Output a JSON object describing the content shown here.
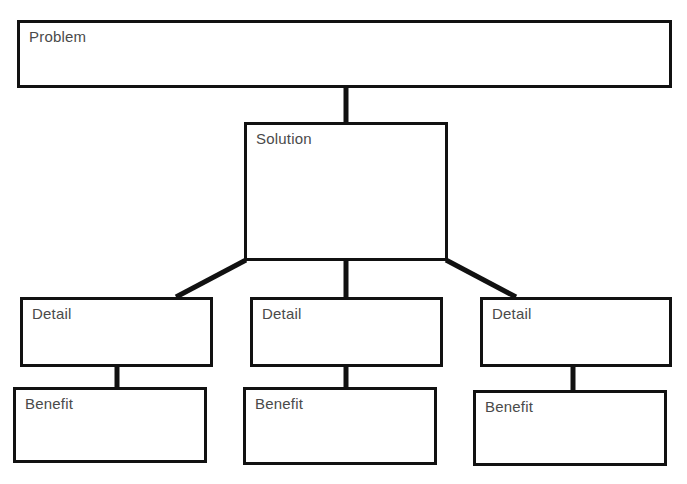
{
  "diagram": {
    "type": "hierarchy-tree",
    "title_strip": "",
    "canvas": {
      "width": 687,
      "height": 484,
      "background": "#ffffff"
    },
    "style": {
      "box_border_color": "#111111",
      "box_fill_color": "#ffffff",
      "connector_color": "#111111",
      "label_color": "#4a4a4a"
    },
    "nodes": [
      {
        "id": "problem",
        "label": "Problem",
        "level": 1,
        "x": 17,
        "y": 20,
        "width": 655,
        "height": 68
      },
      {
        "id": "solution",
        "label": "Solution",
        "level": 2,
        "x": 244,
        "y": 122,
        "width": 204,
        "height": 139
      },
      {
        "id": "detail-1",
        "label": "Detail",
        "level": 3,
        "x": 20,
        "y": 297,
        "width": 193,
        "height": 70
      },
      {
        "id": "detail-2",
        "label": "Detail",
        "level": 3,
        "x": 250,
        "y": 297,
        "width": 193,
        "height": 70
      },
      {
        "id": "detail-3",
        "label": "Detail",
        "level": 3,
        "x": 480,
        "y": 297,
        "width": 192,
        "height": 70
      },
      {
        "id": "benefit-1",
        "label": "Benefit",
        "level": 4,
        "x": 13,
        "y": 387,
        "width": 194,
        "height": 76
      },
      {
        "id": "benefit-2",
        "label": "Benefit",
        "level": 4,
        "x": 243,
        "y": 387,
        "width": 194,
        "height": 78
      },
      {
        "id": "benefit-3",
        "label": "Benefit",
        "level": 4,
        "x": 473,
        "y": 390,
        "width": 194,
        "height": 76
      }
    ],
    "connectors": [
      {
        "id": "problem-to-solution",
        "from": "problem",
        "to": "solution",
        "kind": "vertical",
        "x1": 346,
        "y1": 88,
        "x2": 346,
        "y2": 124,
        "width": 5
      },
      {
        "id": "solution-to-detail-1",
        "from": "solution",
        "to": "detail-1",
        "kind": "diagonal",
        "x1": 246,
        "y1": 260,
        "x2": 176,
        "y2": 297,
        "width": 5
      },
      {
        "id": "solution-to-detail-2",
        "from": "solution",
        "to": "detail-2",
        "kind": "vertical",
        "x1": 346,
        "y1": 260,
        "x2": 346,
        "y2": 299,
        "width": 5
      },
      {
        "id": "solution-to-detail-3",
        "from": "solution",
        "to": "detail-3",
        "kind": "diagonal",
        "x1": 446,
        "y1": 260,
        "x2": 516,
        "y2": 297,
        "width": 5
      },
      {
        "id": "detail-1-to-benefit-1",
        "from": "detail-1",
        "to": "benefit-1",
        "kind": "vertical",
        "x1": 117,
        "y1": 366,
        "x2": 117,
        "y2": 389,
        "width": 5
      },
      {
        "id": "detail-2-to-benefit-2",
        "from": "detail-2",
        "to": "benefit-2",
        "kind": "vertical",
        "x1": 346,
        "y1": 366,
        "x2": 346,
        "y2": 389,
        "width": 5
      },
      {
        "id": "detail-3-to-benefit-3",
        "from": "detail-3",
        "to": "benefit-3",
        "kind": "vertical",
        "x1": 573,
        "y1": 366,
        "x2": 573,
        "y2": 392,
        "width": 5
      }
    ]
  }
}
